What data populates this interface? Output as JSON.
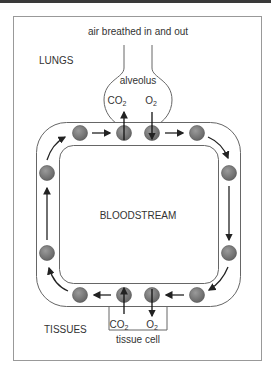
{
  "diagram": {
    "title_top": "air breathed in and out",
    "regions": {
      "lungs": "LUNGS",
      "bloodstream": "BLOODSTREAM",
      "tissues": "TISSUES"
    },
    "alveolus": {
      "label": "alveolus",
      "co2": "CO",
      "co2_sub": "2",
      "o2": "O",
      "o2_sub": "2"
    },
    "tissue_cell": {
      "label": "tissue cell",
      "co2": "CO",
      "co2_sub": "2",
      "o2": "O",
      "o2_sub": "2"
    },
    "colors": {
      "blood_cell": "#7a7a7a",
      "blood_cell_stroke": "#444444",
      "line": "#555555",
      "arrow": "#222222",
      "frame": "#999999"
    }
  }
}
